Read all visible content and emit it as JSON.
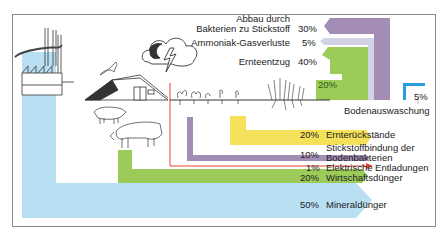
{
  "colors": {
    "mineral": "#b8dff2",
    "wirtschaft": "#9ccb5a",
    "elektrisch": "#e8442a",
    "bakterien": "#a48db5",
    "ernterueck": "#f5e05a",
    "ammoniak": "#d2d4e6",
    "auswaschung": "#2a9be0",
    "frame": "#8a8a8a"
  },
  "inputs": [
    {
      "percent": "50%",
      "label": "Mineraldünger"
    },
    {
      "percent": "20%",
      "label": "Wirtschaftsdünger"
    },
    {
      "percent": "1%",
      "label": "Elektrische Entladungen"
    },
    {
      "percent": "10%",
      "label_line1": "Stickstoffbindung der",
      "label_line2": "Bodenbakterien"
    },
    {
      "percent": "20%",
      "label": "Ernterückstände"
    }
  ],
  "outputs": [
    {
      "percent": "30%",
      "label_line1": "Abbau durch",
      "label_line2": "Bakterien zu Stickstoff"
    },
    {
      "percent": "5%",
      "label": "Ammoniak-Gasverluste"
    },
    {
      "percent": "40%",
      "label": "Ernteentzug"
    },
    {
      "percent": "20%",
      "label": ""
    },
    {
      "percent": "5%",
      "label": "Bodenauswaschung"
    }
  ],
  "illustrations": [
    "factory-icon",
    "farm-icon",
    "rooster-icon",
    "pig-icon",
    "cow-icon",
    "thundercloud-icon",
    "crops-icon",
    "grain-icon"
  ]
}
